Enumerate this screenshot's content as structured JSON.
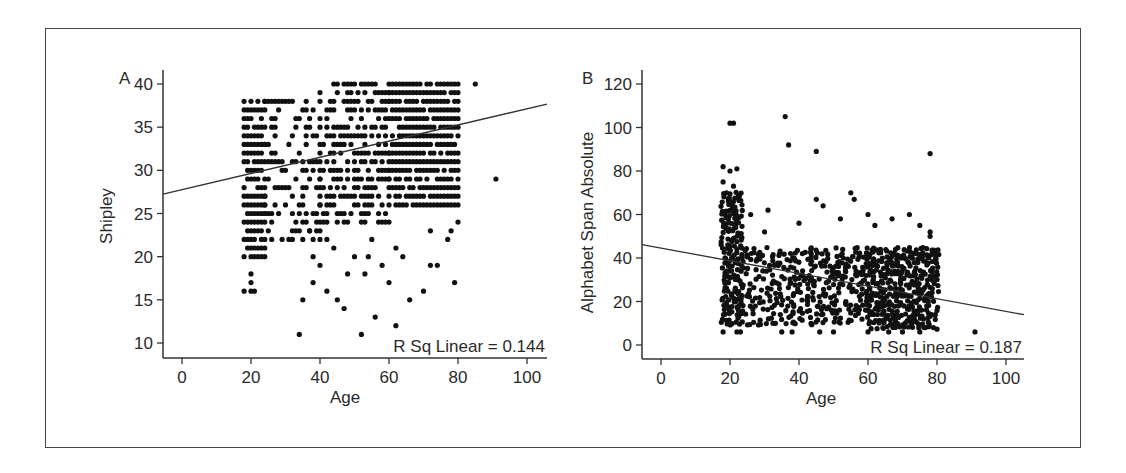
{
  "figure": {
    "background": "#ffffff",
    "frame_color": "#444444",
    "dot_color": "#111111",
    "line_color": "#333333"
  },
  "chart_data": [
    {
      "panel": "A",
      "type": "scatter",
      "title": "",
      "xlabel": "Age",
      "ylabel": "Shipley",
      "xlim": [
        -5,
        105
      ],
      "ylim": [
        8.5,
        41.5
      ],
      "xticks": [
        0,
        20,
        40,
        60,
        80,
        100
      ],
      "yticks": [
        10,
        15,
        20,
        25,
        30,
        35,
        40
      ],
      "grid": false,
      "annotation": "R Sq Linear = 0.144",
      "fit_line": {
        "x": [
          -5,
          105
        ],
        "y": [
          27.3,
          37.6
        ]
      },
      "clusters": [
        {
          "x_range": [
            18,
            24
          ],
          "y_range": [
            20,
            38
          ],
          "density": 0.85
        },
        {
          "x_range": [
            24,
            40
          ],
          "y_range": [
            22,
            38
          ],
          "density": 0.35
        },
        {
          "x_range": [
            40,
            60
          ],
          "y_range": [
            24,
            40
          ],
          "density": 0.55
        },
        {
          "x_range": [
            60,
            80
          ],
          "y_range": [
            26,
            40
          ],
          "density": 0.85
        }
      ],
      "points": [
        [
          18,
          16
        ],
        [
          20,
          16
        ],
        [
          21,
          16
        ],
        [
          20,
          17
        ],
        [
          20,
          18
        ],
        [
          34,
          11
        ],
        [
          35,
          15
        ],
        [
          38,
          17
        ],
        [
          42,
          16
        ],
        [
          45,
          15
        ],
        [
          47,
          14
        ],
        [
          52,
          11
        ],
        [
          53,
          18
        ],
        [
          56,
          13
        ],
        [
          60,
          17
        ],
        [
          62,
          12
        ],
        [
          66,
          15
        ],
        [
          64,
          20
        ],
        [
          38,
          20
        ],
        [
          42,
          22
        ],
        [
          48,
          18
        ],
        [
          50,
          20
        ],
        [
          55,
          22
        ],
        [
          58,
          19
        ],
        [
          70,
          16
        ],
        [
          72,
          19
        ],
        [
          74,
          19
        ],
        [
          77,
          22
        ],
        [
          78,
          23
        ],
        [
          79,
          17
        ],
        [
          80,
          24
        ],
        [
          91,
          29
        ],
        [
          85,
          40
        ],
        [
          72,
          23
        ],
        [
          40,
          19
        ],
        [
          44,
          21
        ],
        [
          33,
          23
        ],
        [
          37,
          23
        ],
        [
          54,
          20
        ],
        [
          62,
          21
        ]
      ]
    },
    {
      "panel": "B",
      "type": "scatter",
      "title": "",
      "xlabel": "Age",
      "ylabel": "Alphabet Span Absolute",
      "xlim": [
        -5,
        105
      ],
      "ylim": [
        -3,
        125
      ],
      "xticks": [
        0,
        20,
        40,
        60,
        80,
        100
      ],
      "yticks": [
        0,
        20,
        40,
        60,
        80,
        100,
        120
      ],
      "grid": false,
      "annotation": "R Sq Linear = 0.187",
      "fit_line": {
        "x": [
          -5,
          105
        ],
        "y": [
          46,
          14
        ]
      },
      "clusters": [
        {
          "x_range": [
            18,
            23
          ],
          "y_range": [
            10,
            70
          ],
          "density": 0.9
        },
        {
          "x_range": [
            23,
            38
          ],
          "y_range": [
            10,
            45
          ],
          "density": 0.35
        },
        {
          "x_range": [
            38,
            60
          ],
          "y_range": [
            10,
            45
          ],
          "density": 0.55
        },
        {
          "x_range": [
            60,
            80
          ],
          "y_range": [
            8,
            45
          ],
          "density": 0.85
        }
      ],
      "points": [
        [
          20,
          102
        ],
        [
          21,
          102
        ],
        [
          36,
          105
        ],
        [
          37,
          92
        ],
        [
          45,
          89
        ],
        [
          78,
          88
        ],
        [
          18,
          82
        ],
        [
          20,
          80
        ],
        [
          22,
          81
        ],
        [
          18,
          75
        ],
        [
          21,
          73
        ],
        [
          19,
          70
        ],
        [
          18,
          6
        ],
        [
          22,
          6
        ],
        [
          23,
          6
        ],
        [
          35,
          6
        ],
        [
          38,
          6
        ],
        [
          46,
          6
        ],
        [
          50,
          6
        ],
        [
          60,
          6
        ],
        [
          66,
          6
        ],
        [
          70,
          6
        ],
        [
          75,
          6
        ],
        [
          91,
          6
        ],
        [
          45,
          67
        ],
        [
          47,
          64
        ],
        [
          55,
          70
        ],
        [
          56,
          67
        ],
        [
          26,
          60
        ],
        [
          31,
          62
        ],
        [
          60,
          60
        ],
        [
          67,
          58
        ],
        [
          72,
          60
        ],
        [
          75,
          55
        ],
        [
          78,
          52
        ],
        [
          78,
          50
        ],
        [
          40,
          56
        ],
        [
          30,
          52
        ],
        [
          52,
          58
        ],
        [
          62,
          55
        ]
      ]
    }
  ]
}
